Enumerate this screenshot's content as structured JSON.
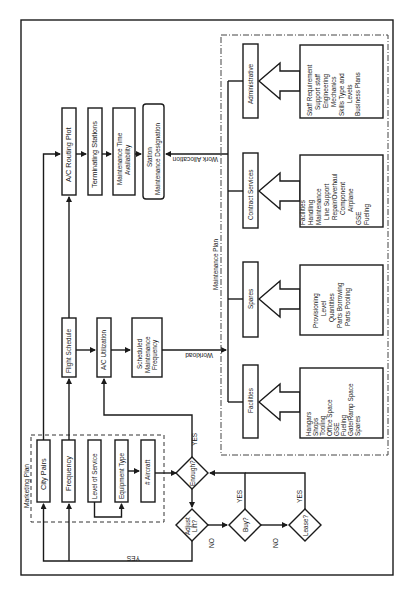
{
  "diagram": {
    "groups": {
      "marketing_plan": "Marketing Plan",
      "maintenance_plan": "Maintenance Plan"
    },
    "marketing_nodes": {
      "city_pairs": "City Pairs",
      "frequency": "Frequency",
      "level_of_service": "Level of Service",
      "equipment_type": "Equipment Type",
      "num_aircraft": "# Aircraft"
    },
    "schedule_nodes": {
      "flight_schedule": "Flight Schedule",
      "ac_utilization": "A/C Utilization",
      "sched_maint_freq": [
        "Scheduled",
        "Maintenance",
        "Frequency"
      ]
    },
    "routing_nodes": {
      "ac_routing_plot": "A/C Routing Plot",
      "terminating_stations": "Terminating Stations",
      "maint_time_avail": [
        "Maintenance Time",
        "Availability"
      ],
      "station_maint_designation": [
        "Station",
        "Maintenance Designation"
      ]
    },
    "decisions": {
      "enough": "Enough?",
      "adjust_lift": [
        "Adjust",
        "Lift?"
      ],
      "buy": "Buy?",
      "lease": "Lease?"
    },
    "edge_labels": {
      "yes_enough": "YES",
      "yes_adjust": "YES",
      "no_adjust": "NO",
      "yes_buy": "YES",
      "no_buy": "NO",
      "yes_lease": "YES",
      "workload": "Workload",
      "work_allocation": "Work Allocation"
    },
    "maintenance_categories": {
      "facilities": {
        "label": "Facilities",
        "items": [
          "Hangars",
          "Shops",
          "Tooling",
          "Office Space",
          "GSE",
          "Fueling",
          "Gate/Ramp Space",
          "Spares"
        ]
      },
      "spares": {
        "label": "Spares",
        "items": [
          "Provisioning",
          "Level",
          "Quantities",
          "Parts Borrowing",
          "Parts Pooling"
        ]
      },
      "contract_services": {
        "label": "Contract Services",
        "items": [
          "Facilities",
          "Handling",
          "Maintenance",
          "Line Support",
          "Repair/Overhaul",
          "Component",
          "Airplane",
          "GSE",
          "Fueling"
        ]
      },
      "administrative": {
        "label": "Administrative",
        "items": [
          "Staff Requirement",
          "Support staff",
          "Engineering",
          "Mechanics",
          "Skills Type and",
          "Levels",
          "Business Plans"
        ]
      }
    }
  }
}
